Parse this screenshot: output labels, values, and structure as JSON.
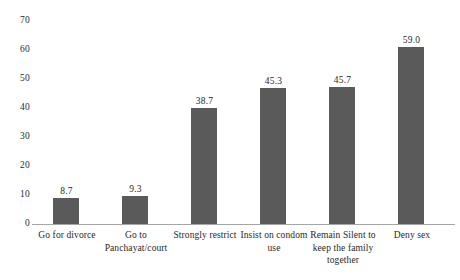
{
  "chart_data": {
    "type": "bar",
    "title": "",
    "subtitle": "",
    "xlabel": "",
    "ylabel": "",
    "ylim": [
      0,
      70
    ],
    "y_ticks": [
      "0",
      "10",
      "20",
      "30",
      "40",
      "50",
      "60",
      "70"
    ],
    "grid": false,
    "legend": false,
    "orientation": "vertical",
    "series_color": "#5a5a5a",
    "axis_color": "#a6a6a6",
    "categories": [
      "Go for divorce",
      "Go to Panchayat/court",
      "Strongly restrict",
      "Insist on condom use",
      "Remain Silent to keep the family together",
      "Deny sex"
    ],
    "category_lines": [
      [
        "Go for divorce"
      ],
      [
        "Go to",
        "Panchayat/court"
      ],
      [
        "Strongly restrict"
      ],
      [
        "Insist on condom",
        "use"
      ],
      [
        "Remain Silent to",
        "keep the family",
        "together"
      ],
      [
        "Deny sex"
      ]
    ],
    "values": [
      8.7,
      9.3,
      38.7,
      45.3,
      45.7,
      59.0
    ],
    "value_labels": [
      "8.7",
      "9.3",
      "38.7",
      "45.3",
      "45.7",
      "59.0"
    ]
  }
}
